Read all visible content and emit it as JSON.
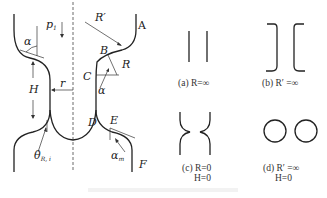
{
  "main_diagram": {
    "labels": {
      "pressure": "p",
      "pressure_sub": "1",
      "r_prime": "R′",
      "point_a": "A",
      "point_b": "B",
      "r": "R",
      "point_c": "C",
      "alpha_right": "α",
      "alpha_left": "α",
      "height": "H",
      "radius": "r",
      "point_d": "D",
      "point_e": "E",
      "theta": "θ",
      "theta_sub": "R, i",
      "alpha_m": "α",
      "alpha_m_sub": "m",
      "point_f": "F"
    }
  },
  "sub_diagrams": [
    {
      "id": "a",
      "caption": "(a) R=∞"
    },
    {
      "id": "b",
      "caption": "(b) R′ =∞"
    },
    {
      "id": "c",
      "caption": "(c) R=0",
      "caption2": "H=0"
    },
    {
      "id": "d",
      "caption": "(d) R′ =∞",
      "caption2": "H=0"
    }
  ],
  "figure_caption": ""
}
